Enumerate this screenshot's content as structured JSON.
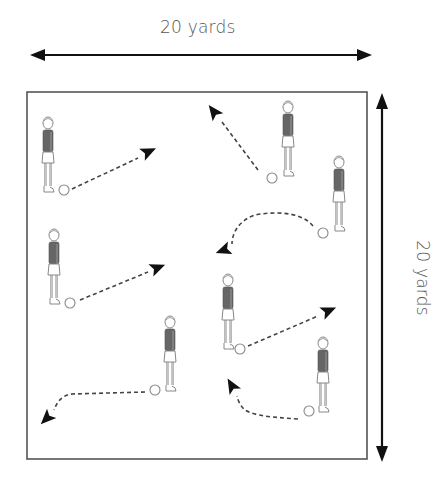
{
  "diagram": {
    "type": "soccer drill field layout",
    "width_label": "20 yards",
    "height_label": "20 yards",
    "field": {
      "left": 27,
      "top": 92,
      "right": 367,
      "bottom": 459,
      "stroke": "#555555"
    },
    "colors": {
      "arrow": "#111111",
      "dashed_pass": "#444444",
      "shirt": "#666666",
      "outline": "#888888"
    },
    "players": [
      {
        "id": "p1",
        "x": 48,
        "y": 118,
        "ball": {
          "x": 64,
          "y": 190
        }
      },
      {
        "id": "p2",
        "x": 288,
        "y": 102,
        "ball": {
          "x": 272,
          "y": 178
        }
      },
      {
        "id": "p3",
        "x": 339,
        "y": 157,
        "ball": {
          "x": 323,
          "y": 233
        }
      },
      {
        "id": "p4",
        "x": 54,
        "y": 230,
        "ball": {
          "x": 70,
          "y": 303
        }
      },
      {
        "id": "p5",
        "x": 228,
        "y": 275,
        "ball": {
          "x": 240,
          "y": 349
        }
      },
      {
        "id": "p6",
        "x": 170,
        "y": 317,
        "ball": {
          "x": 155,
          "y": 390
        }
      },
      {
        "id": "p7",
        "x": 323,
        "y": 338,
        "ball": {
          "x": 309,
          "y": 411
        }
      }
    ],
    "passes": [
      {
        "id": "pass1",
        "path": "M72 189 L138 158",
        "head": {
          "x": 148,
          "y": 152,
          "angle": -25
        }
      },
      {
        "id": "pass2",
        "path": "M258 170 L222 122",
        "head": {
          "x": 214,
          "y": 112,
          "angle": -127
        }
      },
      {
        "id": "pass3",
        "path": "M313 226 C300 210, 270 212, 255 215 C240 220, 232 232, 232 244",
        "head": {
          "x": 224,
          "y": 250,
          "angle": 160
        }
      },
      {
        "id": "pass4",
        "path": "M80 300 L148 272",
        "head": {
          "x": 157,
          "y": 268,
          "angle": -22
        }
      },
      {
        "id": "pass5",
        "path": "M248 346 L318 316",
        "head": {
          "x": 328,
          "y": 311,
          "angle": -23
        }
      },
      {
        "id": "pass6",
        "path": "M145 392 L72 394 C62 395, 57 402, 54 410",
        "head": {
          "x": 47,
          "y": 418,
          "angle": 135
        }
      },
      {
        "id": "pass7",
        "path": "M298 419 C270 417, 255 416, 245 410 C240 406, 238 400, 237 396",
        "head": {
          "x": 232,
          "y": 386,
          "angle": -120
        }
      }
    ],
    "dimension_arrows": {
      "horizontal": {
        "x1": 30,
        "x2": 372,
        "y": 55
      },
      "vertical": {
        "x": 382,
        "y1": 93,
        "y2": 462
      }
    }
  }
}
